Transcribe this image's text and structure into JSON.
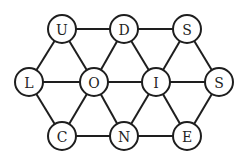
{
  "diagram": {
    "type": "letter-grid-graph",
    "node_radius": 14,
    "colors": {
      "stroke": "#1e1e1e",
      "fill": "#ffffff",
      "text": "#1e1e1e",
      "background": "#ffffff"
    },
    "nodes": [
      {
        "id": "u",
        "label": "U",
        "x": 62,
        "y": 29
      },
      {
        "id": "d",
        "label": "D",
        "x": 124,
        "y": 29
      },
      {
        "id": "s1",
        "label": "S",
        "x": 187,
        "y": 29
      },
      {
        "id": "l",
        "label": "L",
        "x": 29,
        "y": 82
      },
      {
        "id": "o",
        "label": "O",
        "x": 94,
        "y": 82
      },
      {
        "id": "i",
        "label": "I",
        "x": 156,
        "y": 82
      },
      {
        "id": "s2",
        "label": "S",
        "x": 219,
        "y": 82
      },
      {
        "id": "c",
        "label": "C",
        "x": 62,
        "y": 136
      },
      {
        "id": "n",
        "label": "N",
        "x": 124,
        "y": 136
      },
      {
        "id": "e",
        "label": "E",
        "x": 187,
        "y": 136
      }
    ],
    "edges": [
      [
        "u",
        "d"
      ],
      [
        "d",
        "s1"
      ],
      [
        "l",
        "o"
      ],
      [
        "o",
        "i"
      ],
      [
        "i",
        "s2"
      ],
      [
        "c",
        "n"
      ],
      [
        "n",
        "e"
      ],
      [
        "u",
        "l"
      ],
      [
        "u",
        "o"
      ],
      [
        "d",
        "o"
      ],
      [
        "d",
        "i"
      ],
      [
        "s1",
        "i"
      ],
      [
        "s1",
        "s2"
      ],
      [
        "l",
        "c"
      ],
      [
        "o",
        "c"
      ],
      [
        "o",
        "n"
      ],
      [
        "i",
        "n"
      ],
      [
        "i",
        "e"
      ],
      [
        "s2",
        "e"
      ]
    ]
  }
}
